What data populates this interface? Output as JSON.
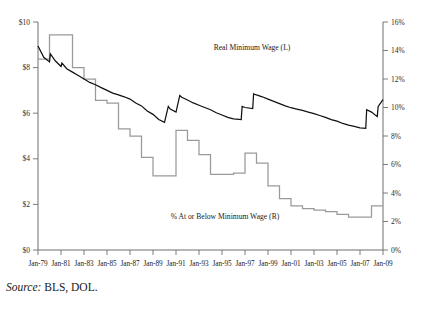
{
  "chart_data": {
    "type": "line",
    "title": "",
    "xlabel": "",
    "ylabel": "",
    "grid": false,
    "legend_position": "inline-annotation",
    "x_tick_labels": [
      "Jan-79",
      "Jan-81",
      "Jan-83",
      "Jan-85",
      "Jan-87",
      "Jan-89",
      "Jan-91",
      "Jan-93",
      "Jan-95",
      "Jan-97",
      "Jan-99",
      "Jan-01",
      "Jan-03",
      "Jan-05",
      "Jan-07",
      "Jan-09"
    ],
    "left_axis": {
      "tick_labels": [
        "$0",
        "$2",
        "$4",
        "$6",
        "$8",
        "$10"
      ],
      "ylim": [
        0,
        10
      ],
      "unit": "dollars"
    },
    "right_axis": {
      "tick_labels": [
        "0%",
        "2%",
        "4%",
        "6%",
        "8%",
        "10%",
        "12%",
        "14%",
        "16%"
      ],
      "ylim": [
        0,
        16
      ],
      "unit": "percent"
    },
    "series": [
      {
        "name": "Real Minimum Wage (L)",
        "axis": "left",
        "color": "#111111",
        "style": "sawtooth-step",
        "x": [
          1979.0,
          1979.5,
          1980.0,
          1980.08,
          1980.5,
          1981.0,
          1981.08,
          1981.5,
          1982.0,
          1982.5,
          1983.0,
          1983.5,
          1984.0,
          1984.5,
          1985.0,
          1985.5,
          1986.0,
          1986.5,
          1987.0,
          1987.5,
          1988.0,
          1988.5,
          1989.0,
          1989.5,
          1990.0,
          1990.33,
          1990.5,
          1991.0,
          1991.33,
          1991.5,
          1992.0,
          1992.5,
          1993.0,
          1993.5,
          1994.0,
          1994.5,
          1995.0,
          1995.5,
          1996.0,
          1996.67,
          1996.75,
          1997.0,
          1997.67,
          1997.75,
          1998.0,
          1998.5,
          1999.0,
          1999.5,
          2000.0,
          2000.5,
          2001.0,
          2001.5,
          2002.0,
          2002.5,
          2003.0,
          2003.5,
          2004.0,
          2004.5,
          2005.0,
          2005.5,
          2006.0,
          2006.5,
          2007.0,
          2007.5,
          2007.58,
          2008.0,
          2008.5,
          2008.58,
          2009.0
        ],
        "y": [
          8.95,
          8.45,
          8.25,
          8.6,
          8.3,
          8.05,
          8.2,
          7.95,
          7.8,
          7.65,
          7.5,
          7.35,
          7.25,
          7.12,
          7.0,
          6.88,
          6.8,
          6.72,
          6.62,
          6.45,
          6.32,
          6.1,
          5.95,
          5.72,
          5.6,
          6.3,
          6.18,
          6.05,
          6.78,
          6.7,
          6.58,
          6.45,
          6.35,
          6.25,
          6.15,
          6.02,
          5.92,
          5.82,
          5.75,
          5.72,
          6.3,
          6.25,
          6.2,
          6.85,
          6.8,
          6.72,
          6.62,
          6.52,
          6.42,
          6.32,
          6.24,
          6.18,
          6.12,
          6.05,
          5.98,
          5.9,
          5.82,
          5.72,
          5.65,
          5.55,
          5.48,
          5.42,
          5.36,
          5.34,
          6.15,
          6.05,
          5.85,
          6.3,
          6.6
        ],
        "annotation": {
          "text": "Real Minimum Wage (L)",
          "x": 1997.0,
          "y": 9.1
        }
      },
      {
        "name": "% At or Below Minimum Wage (R)",
        "axis": "right",
        "color": "#9a9a9a",
        "style": "step",
        "x": [
          1979,
          1980,
          1981,
          1982,
          1983,
          1984,
          1985,
          1986,
          1987,
          1988,
          1989,
          1990,
          1991,
          1992,
          1993,
          1994,
          1995,
          1996,
          1997,
          1998,
          1999,
          2000,
          2001,
          2002,
          2003,
          2004,
          2005,
          2006,
          2007,
          2008,
          2009
        ],
        "y": [
          13.4,
          15.1,
          15.1,
          12.8,
          12.0,
          10.5,
          10.3,
          8.5,
          8.0,
          6.5,
          5.2,
          5.2,
          8.4,
          7.7,
          6.7,
          5.3,
          5.3,
          5.4,
          6.8,
          6.1,
          4.5,
          3.6,
          3.1,
          2.9,
          2.8,
          2.7,
          2.5,
          2.3,
          2.3,
          3.1,
          3.1
        ],
        "annotation": {
          "text": "% At or Below Minimum Wage (R)",
          "x": 1993.0,
          "y": 2.9
        }
      }
    ],
    "source_note": {
      "prefix": "Source:",
      "text": " BLS, DOL."
    }
  }
}
